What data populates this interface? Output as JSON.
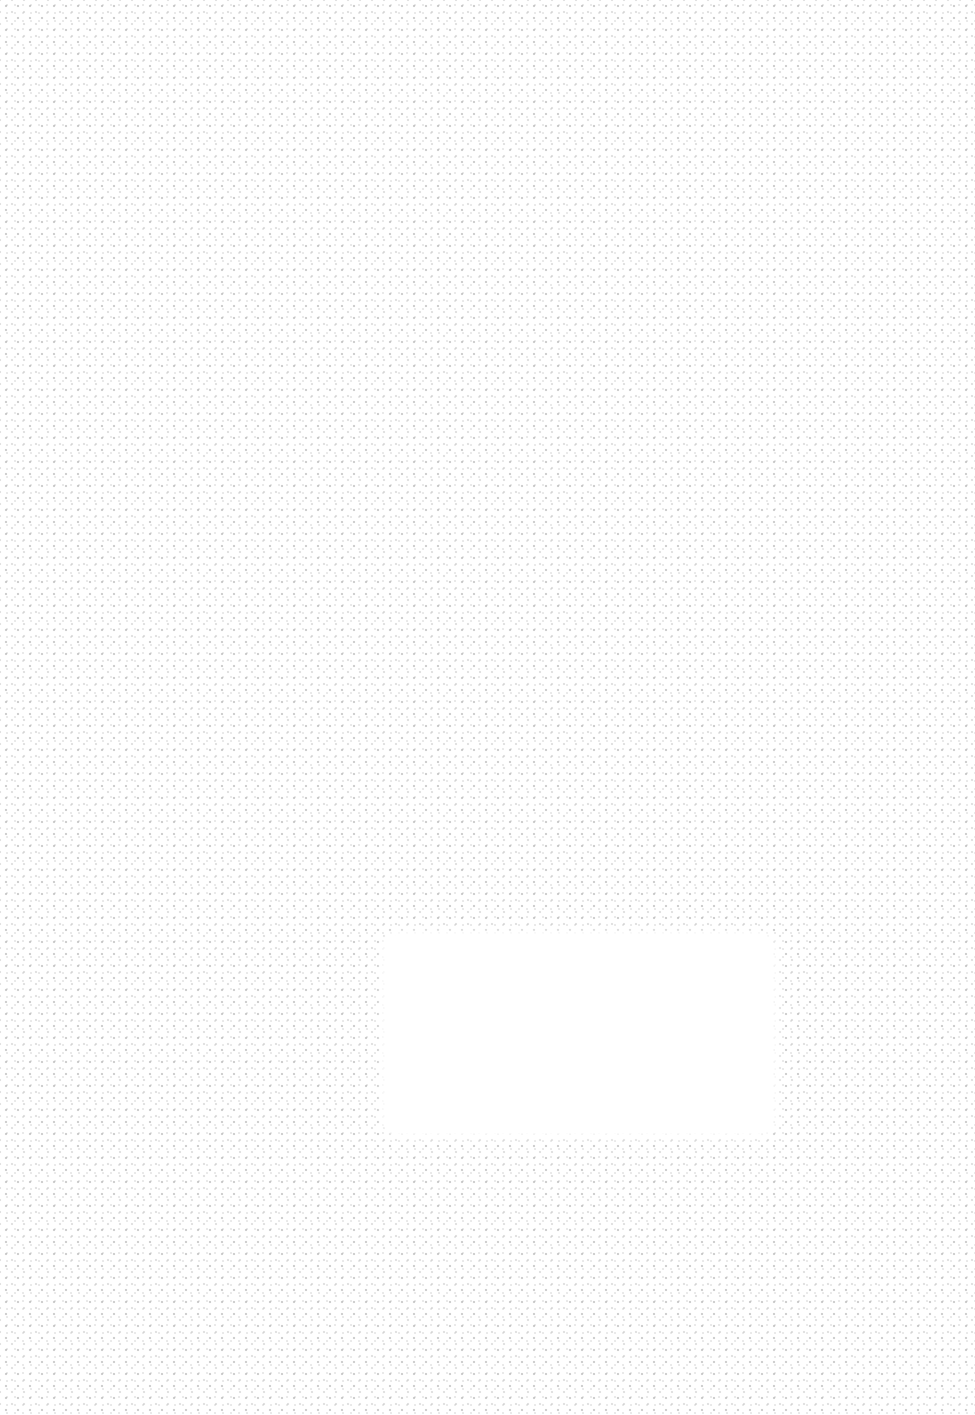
{
  "background": {
    "pattern": "dotted-texture",
    "color": "#ffffff",
    "dot_color": "#a0a0a0"
  },
  "panel": {
    "text": ""
  }
}
